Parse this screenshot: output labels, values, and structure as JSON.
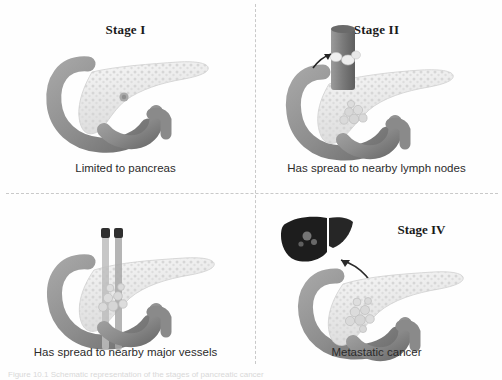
{
  "figure": {
    "bottom_caption": "Figure 10.1 Schematic representation of the stages of pancreatic cancer",
    "divider_color": "#c9c9c9",
    "background": "#ffffff"
  },
  "palette": {
    "duodenum": "#8f8f8f",
    "duodenum_shadow": "#6f6f6f",
    "pancreas": "#efefef",
    "pancreas_speckle": "#d4d4d4",
    "tumor": "#bdbdbd",
    "vessel": "#9a9a9a",
    "vessel_dark": "#3a3a3a",
    "liver": "#1f1f1f",
    "arrow": "#2a2a2a",
    "title_color": "#1a1a1a",
    "caption_color": "#2b2b2b"
  },
  "panels": [
    {
      "id": "stage-1",
      "title": "Stage I",
      "caption": "Limited to pancreas",
      "features": [
        "duodenum",
        "pancreas",
        "small-tumor"
      ]
    },
    {
      "id": "stage-2",
      "title": "Stage II",
      "caption": "Has spread to nearby lymph nodes",
      "features": [
        "duodenum",
        "pancreas",
        "tumor-cluster",
        "bile-duct",
        "lymph-nodes",
        "arrow"
      ]
    },
    {
      "id": "stage-3",
      "title": "Stage III",
      "caption": "Has spread to nearby major vessels",
      "features": [
        "duodenum",
        "pancreas",
        "tumor-cluster",
        "major-vessels"
      ]
    },
    {
      "id": "stage-4",
      "title": "Stage IV",
      "caption": "Metastatic cancer",
      "features": [
        "duodenum",
        "pancreas",
        "tumor-cluster",
        "liver",
        "metastasis-arrow"
      ]
    }
  ]
}
